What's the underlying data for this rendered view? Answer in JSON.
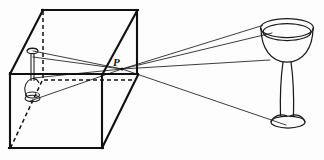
{
  "figure": {
    "kind": "line-diagram",
    "background_color": "#fdfdfd",
    "ink_color": "#1a1a1a",
    "width": 324,
    "height": 160
  },
  "labels": {
    "pinhole": "P"
  },
  "parts": {
    "box_name": "pinhole-camera-box",
    "object_name": "wine-glass-object",
    "image_name": "inverted-wine-glass-image",
    "rays_name": "light-rays",
    "pinhole_name": "pinhole-point"
  },
  "geometry": {
    "pinhole": [
      122,
      69
    ],
    "box_visible_edges": [
      [
        [
          10,
          74
        ],
        [
          43,
          10
        ]
      ],
      [
        [
          43,
          10
        ],
        [
          137,
          10
        ]
      ],
      [
        [
          137,
          10
        ],
        [
          137,
          74
        ]
      ],
      [
        [
          10,
          74
        ],
        [
          10,
          148
        ]
      ],
      [
        [
          10,
          148
        ],
        [
          102,
          148
        ]
      ],
      [
        [
          102,
          148
        ],
        [
          102,
          74
        ]
      ],
      [
        [
          102,
          148
        ],
        [
          137,
          74
        ]
      ],
      [
        [
          137,
          10
        ],
        [
          102,
          74
        ]
      ],
      [
        [
          10,
          74
        ],
        [
          137,
          74
        ]
      ]
    ],
    "box_hidden_edges": [
      [
        [
          43,
          10
        ],
        [
          43,
          80
        ]
      ],
      [
        [
          43,
          80
        ],
        [
          137,
          80
        ]
      ],
      [
        [
          43,
          80
        ],
        [
          10,
          148
        ]
      ]
    ],
    "rays_object_to_pinhole": [
      [
        [
          122,
          69
        ],
        [
          262,
          26
        ]
      ],
      [
        [
          122,
          69
        ],
        [
          271,
          33
        ]
      ],
      [
        [
          122,
          69
        ],
        [
          269,
          61
        ]
      ],
      [
        [
          122,
          69
        ],
        [
          285,
          125
        ]
      ]
    ],
    "rays_pinhole_to_image": [
      [
        [
          122,
          69
        ],
        [
          33,
          52
        ]
      ],
      [
        [
          122,
          69
        ],
        [
          33,
          58
        ]
      ],
      [
        [
          122,
          69
        ],
        [
          33,
          78
        ]
      ],
      [
        [
          122,
          69
        ],
        [
          30,
          101
        ]
      ]
    ],
    "glass_rim_ellipse": {
      "cx": 287,
      "cy": 29,
      "rx": 27,
      "ry": 9
    },
    "glass_foot_ellipse": {
      "cx": 288,
      "cy": 123,
      "rx": 17,
      "ry": 6
    }
  }
}
